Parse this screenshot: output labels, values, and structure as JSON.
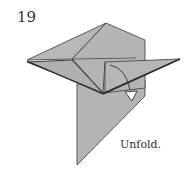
{
  "step": {
    "number": "19",
    "instruction": "Unfold."
  },
  "colors": {
    "paper": "#b4b4b4",
    "paper_dark": "#a8a8a8",
    "edge": "#3a3a3a",
    "arrow_fill": "#ffffff",
    "background": "#ffffff"
  }
}
